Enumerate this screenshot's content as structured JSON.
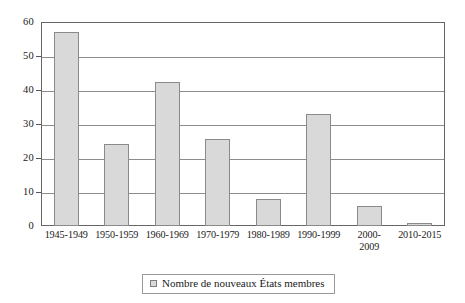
{
  "chart_data": {
    "type": "bar",
    "title": "",
    "xlabel": "",
    "ylabel": "",
    "ylim": [
      0,
      60
    ],
    "yticks": [
      0,
      10,
      20,
      30,
      40,
      50,
      60
    ],
    "grid": true,
    "legend_position": "bottom",
    "categories": [
      "1945-1949",
      "1950-1959",
      "1960-1969",
      "1970-1979",
      "1980-1989",
      "1990-1999",
      "2000-\n2009",
      "2010-2015"
    ],
    "series": [
      {
        "name": "Nombre de nouveaux États membres",
        "values": [
          57,
          24,
          42.5,
          25.5,
          8,
          33,
          6,
          1
        ]
      }
    ]
  },
  "legend": {
    "entries": [
      {
        "label": "Nombre de nouveaux États membres",
        "color": "#d9d9d9"
      }
    ]
  },
  "colors": {
    "bar_fill": "#d9d9d9",
    "bar_stroke": "#8a8a8a",
    "gridline": "#8c8c8c",
    "axis": "#666666",
    "text": "#1a1a1a",
    "background": "#ffffff"
  }
}
